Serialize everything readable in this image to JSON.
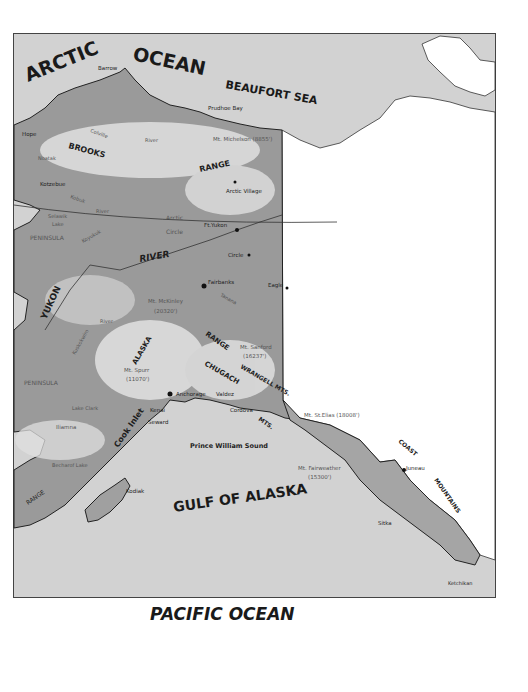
{
  "map": {
    "title": "Alaska",
    "water_labels": {
      "arctic_ocean_1": "ARCTIC",
      "arctic_ocean_2": "OCEAN",
      "beaufort_sea": "BEAUFORT SEA",
      "gulf_of_alaska": "GULF OF ALASKA",
      "pacific_ocean": "PACIFIC OCEAN",
      "prince_william_sound": "Prince William Sound",
      "cook_inlet": "Cook Inlet"
    },
    "regions": {
      "brooks": "BROOKS",
      "range_north": "RANGE",
      "river_yukon_upper": "RIVER",
      "yukon": "YUKON",
      "alaska": "ALASKA",
      "range_alaska": "RANGE",
      "chugach": "CHUGACH",
      "wrangell": "WRANGELL MTS.",
      "mts": "MTS.",
      "coast": "COAST",
      "mountains": "MOUNTAINS",
      "peninsula_seward": "PENINSULA",
      "peninsula_alaska": "PENINSULA",
      "range_aleutian": "RANGE",
      "arctic_circle_1": "Arctic",
      "arctic_circle_2": "Circle"
    },
    "towns": {
      "barrow": "Barrow",
      "prudhoe_bay": "Prudhoe Bay",
      "hope": "Hope",
      "kotzebue": "Kotzebue",
      "arctic_village": "Arctic Village",
      "ft_yukon": "Ft.Yukon",
      "circle": "Circle",
      "fairbanks": "Fairbanks",
      "eagle": "Eagle",
      "anchorage": "Anchorage",
      "valdez": "Valdez",
      "cordova": "Cordova",
      "kenai": "Kenai",
      "seward": "Seward",
      "kodiak": "Kodiak",
      "juneau": "Juneau",
      "sitka": "Sitka",
      "ketchikan": "Ketchikan",
      "iliamna": "Iliamna"
    },
    "peaks": {
      "michelson": "Mt. Michelson (8855')",
      "mckinley_1": "Mt. McKinley",
      "mckinley_2": "(20320')",
      "sanford_1": "Mt. Sanford",
      "sanford_2": "(16237')",
      "spurr_1": "Mt. Spurr",
      "spurr_2": "(11070')",
      "st_elias": "Mt. St.Elias (18008')",
      "fairweather_1": "Mt. Fairweather",
      "fairweather_2": "(15300')"
    },
    "rivers": {
      "colville": "Colville",
      "river1": "River",
      "noatak": "Noatak",
      "kobuk": "Kobuk",
      "river2": "River",
      "koyukuk": "Koyukuk",
      "tanana": "Tanana",
      "kuskokwim": "Kuskokwim",
      "river3": "River",
      "selawik_1": "Selawik",
      "selawik_2": "Lake",
      "lake_clark": "Lake Clark",
      "becharof": "Becharof Lake"
    }
  }
}
